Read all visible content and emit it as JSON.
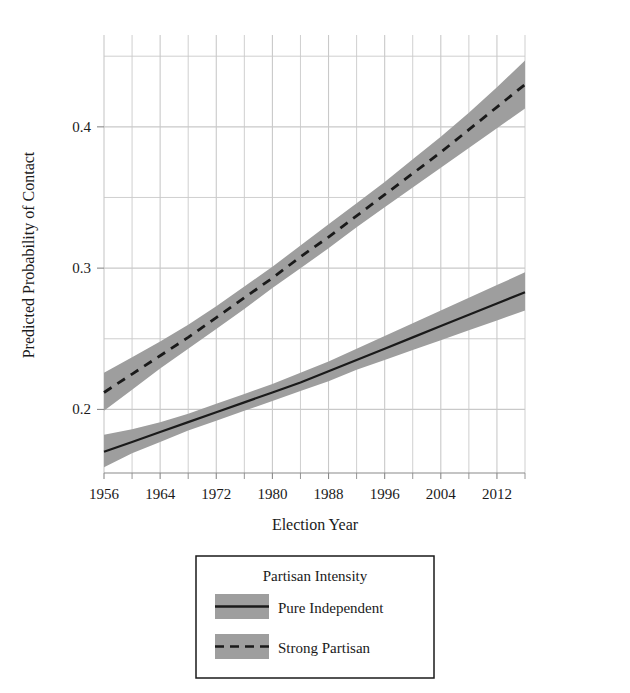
{
  "chart_data": {
    "type": "line",
    "title": "",
    "xlabel": "Election Year",
    "ylabel": "Predicted Probability of Contact",
    "xlim": [
      1956,
      2016
    ],
    "ylim": [
      0.155,
      0.465
    ],
    "grid": true,
    "x_ticks": [
      1956,
      1964,
      1972,
      1980,
      1988,
      1996,
      2004,
      2012
    ],
    "x_tick_labels": [
      "1956",
      "1964",
      "1972",
      "1980",
      "1988",
      "1996",
      "2004",
      "2012"
    ],
    "x_minor_ticks": [
      1960,
      1968,
      1976,
      1984,
      1992,
      2000,
      2008,
      2016
    ],
    "y_ticks": [
      0.2,
      0.3,
      0.4
    ],
    "y_tick_labels": [
      "0.2",
      "0.3",
      "0.4"
    ],
    "y_minor_ticks": [
      0.25,
      0.35,
      0.45
    ],
    "legend": {
      "title": "Partisan Intensity",
      "position": "below-plot",
      "entries": [
        {
          "label": "Pure Independent",
          "style": "solid"
        },
        {
          "label": "Strong Partisan",
          "style": "dashed"
        }
      ]
    },
    "x": [
      1956,
      1960,
      1964,
      1968,
      1972,
      1976,
      1980,
      1984,
      1988,
      1992,
      1996,
      2000,
      2004,
      2008,
      2012,
      2016
    ],
    "series": [
      {
        "name": "Pure Independent",
        "style": "solid",
        "values": [
          0.17,
          0.177,
          0.184,
          0.191,
          0.198,
          0.205,
          0.212,
          0.219,
          0.227,
          0.235,
          0.243,
          0.251,
          0.259,
          0.267,
          0.275,
          0.283
        ],
        "ci_lower": [
          0.159,
          0.169,
          0.177,
          0.185,
          0.192,
          0.199,
          0.206,
          0.213,
          0.22,
          0.228,
          0.235,
          0.242,
          0.249,
          0.256,
          0.263,
          0.27
        ],
        "ci_upper": [
          0.182,
          0.186,
          0.191,
          0.197,
          0.204,
          0.211,
          0.218,
          0.226,
          0.234,
          0.243,
          0.252,
          0.261,
          0.27,
          0.279,
          0.288,
          0.297
        ]
      },
      {
        "name": "Strong Partisan",
        "style": "dashed",
        "values": [
          0.212,
          0.225,
          0.238,
          0.251,
          0.265,
          0.279,
          0.293,
          0.308,
          0.322,
          0.337,
          0.352,
          0.367,
          0.382,
          0.398,
          0.414,
          0.43
        ],
        "ci_lower": [
          0.199,
          0.214,
          0.229,
          0.243,
          0.257,
          0.271,
          0.286,
          0.3,
          0.314,
          0.329,
          0.343,
          0.357,
          0.371,
          0.385,
          0.399,
          0.413
        ],
        "ci_upper": [
          0.226,
          0.237,
          0.248,
          0.26,
          0.273,
          0.287,
          0.301,
          0.316,
          0.331,
          0.346,
          0.361,
          0.377,
          0.393,
          0.41,
          0.428,
          0.447
        ]
      }
    ],
    "colors": {
      "line": "#1a1a1a",
      "band": "#9e9e9e",
      "grid": "#c9c9c9",
      "axis": "#8a8a8a",
      "background": "#ffffff"
    }
  }
}
